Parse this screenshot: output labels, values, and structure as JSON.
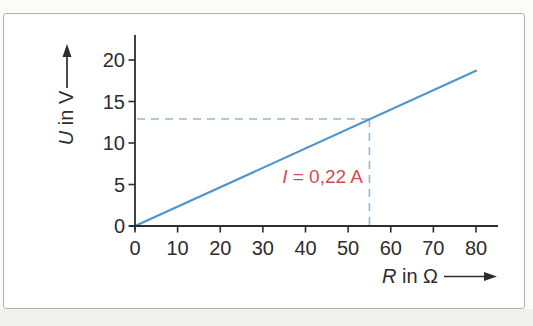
{
  "figure": {
    "page_background": "#fbfbf9",
    "page_bottom_background": "#f0f0ec",
    "box_background": "#ffffff",
    "box_border_color": "#b1b1ad"
  },
  "chart_data": {
    "type": "line",
    "title": "",
    "xlabel": {
      "symbol": "R",
      "rest": " in Ω"
    },
    "ylabel": {
      "symbol": "U",
      "rest": " in V"
    },
    "xlim": [
      0,
      85
    ],
    "ylim": [
      0,
      23
    ],
    "xticks": [
      0,
      10,
      20,
      30,
      40,
      50,
      60,
      70,
      80
    ],
    "yticks": [
      0,
      5,
      10,
      15,
      20
    ],
    "grid": false,
    "legend": "none",
    "axis_color": "#2d2d2d",
    "tick_label_color": "#2d2d2d",
    "series": [
      {
        "name": "U over R straight line through origin",
        "color": "#4f96cf",
        "points": [
          [
            0,
            0
          ],
          [
            80,
            18.7
          ]
        ]
      }
    ],
    "guide": {
      "R": 55,
      "U": 12.9,
      "color": "#8fb9dc",
      "style": "dashed"
    },
    "annotation": {
      "symbol": "I",
      "rest": " = 0,22 A",
      "color": "#d24a52",
      "R": 44,
      "U": 6.0
    }
  }
}
